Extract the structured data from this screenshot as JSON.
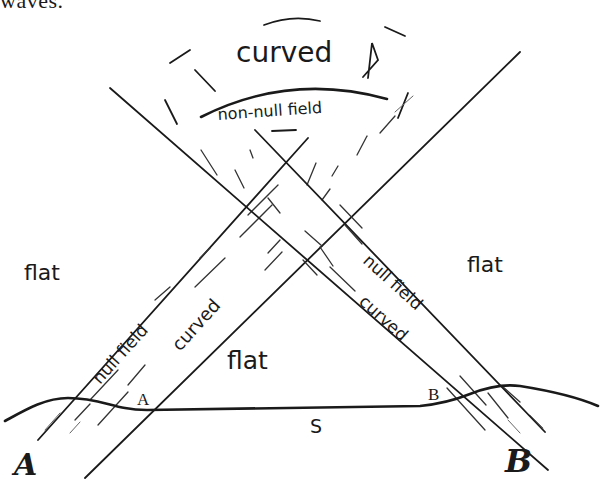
{
  "caption": {
    "text": "waves."
  },
  "diagram": {
    "regions": {
      "top_region_label": "curved",
      "top_region_sublabel": "non-null field",
      "left_outer_label": "flat",
      "right_outer_label": "flat",
      "middle_label": "flat"
    },
    "left_band": {
      "label_outer": "null field",
      "label_inner": "curved"
    },
    "right_band": {
      "label_outer": "null field",
      "label_inner": "curved"
    },
    "surface": {
      "label": "S",
      "point_a_label": "A",
      "point_b_label": "B"
    },
    "observers": {
      "left_label": "A",
      "right_label": "B"
    },
    "stroke_color": "#1a1a1a",
    "background_color": "#ffffff"
  }
}
